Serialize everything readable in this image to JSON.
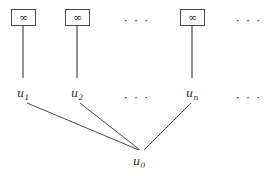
{
  "figure": {
    "background_color": "#ffffff",
    "line_color": "#4a4a4a",
    "text_color": "#1a1a1a",
    "width": 268,
    "height": 176
  },
  "leaf_boxes": [
    {
      "symbol": "∞",
      "x": 11,
      "y": 9,
      "w": 25,
      "h": 17
    },
    {
      "symbol": "∞",
      "x": 65,
      "y": 9,
      "w": 25,
      "h": 17
    },
    {
      "symbol": "∞",
      "x": 180,
      "y": 9,
      "w": 25,
      "h": 17
    }
  ],
  "top_ellipses": [
    {
      "text": "· · ·",
      "x": 124,
      "y": 16
    },
    {
      "text": "· · ·",
      "x": 236,
      "y": 16
    }
  ],
  "mid_nodes": [
    {
      "base": "u",
      "sub": "1",
      "x": 17,
      "y": 88
    },
    {
      "base": "u",
      "sub": "2",
      "x": 71,
      "y": 88
    },
    {
      "base": "u",
      "sub": "n",
      "x": 186,
      "y": 88
    }
  ],
  "mid_ellipses": [
    {
      "text": "· · ·",
      "x": 124,
      "y": 93
    },
    {
      "text": "· · ·",
      "x": 236,
      "y": 93
    }
  ],
  "root_node": {
    "base": "u",
    "sub": "0",
    "x": 133,
    "y": 156
  },
  "vertical_edges": [
    {
      "x1": 23,
      "y1": 26,
      "x2": 23,
      "y2": 78
    },
    {
      "x1": 77,
      "y1": 26,
      "x2": 77,
      "y2": 78
    },
    {
      "x1": 192,
      "y1": 26,
      "x2": 192,
      "y2": 78
    }
  ],
  "diagonal_edges": [
    {
      "x1": 27,
      "y1": 103,
      "x2": 139,
      "y2": 150
    },
    {
      "x1": 80,
      "y1": 103,
      "x2": 140,
      "y2": 150
    },
    {
      "x1": 191,
      "y1": 103,
      "x2": 144,
      "y2": 150
    }
  ]
}
